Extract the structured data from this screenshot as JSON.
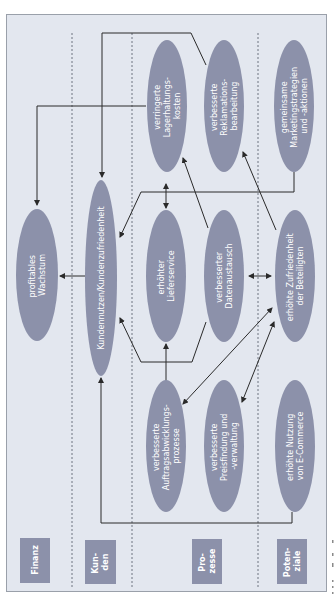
{
  "diagram": {
    "type": "strategy-map",
    "orientation": "rotated-90-ccw",
    "colors": {
      "background": "#e3e7ef",
      "ellipse": "#8c91aa",
      "label_box": "#8c91aa",
      "line": "#2a2a2a",
      "divider": "#6f7480"
    },
    "perspectives": [
      {
        "id": "finanz",
        "label_line1": "Finanz",
        "label_line2": ""
      },
      {
        "id": "kunden",
        "label_line1": "Kun-",
        "label_line2": "den"
      },
      {
        "id": "prozesse",
        "label_line1": "Pro-",
        "label_line2": "zesse"
      },
      {
        "id": "potenziale",
        "label_line1": "Poten-",
        "label_line2": "ziale"
      }
    ],
    "nodes": {
      "wachstum": {
        "line1": "profitables",
        "line2": "Wachstum",
        "line3": ""
      },
      "kundennutzen": {
        "line1": "Kundennutzen/Kundenzufriedenheit",
        "line2": "",
        "line3": ""
      },
      "lagerhaltung": {
        "line1": "verringerte",
        "line2": "Lagerhaltungs-",
        "line3": "kosten"
      },
      "reklamation": {
        "line1": "verbesserte",
        "line2": "Reklamations-",
        "line3": "bearbeitung"
      },
      "marketing": {
        "line1": "gemeinsame",
        "line2": "Marketingstrategien",
        "line3": "und -aktionen"
      },
      "lieferservice": {
        "line1": "erhöhter",
        "line2": "Lieferservice",
        "line3": ""
      },
      "datenaustausch": {
        "line1": "verbesserter",
        "line2": "Datenaustausch",
        "line3": ""
      },
      "zufriedenheit": {
        "line1": "erhöhte Zufriedenheit",
        "line2": "der Beteiligten",
        "line3": ""
      },
      "auftrag": {
        "line1": "verbesserte",
        "line2": "Auftragsabwicklungs-",
        "line3": "prozesse"
      },
      "preisfindung": {
        "line1": "verbesserte",
        "line2": "Preisfindung und",
        "line3": "-verwaltung"
      },
      "ecommerce": {
        "line1": "erhöhte Nutzung",
        "line2": "von E-Commerce",
        "line3": ""
      }
    }
  }
}
